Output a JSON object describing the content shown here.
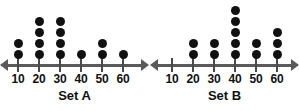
{
  "chart_data": [
    {
      "type": "bar",
      "plot_style": "dot-plot",
      "title": "Set A",
      "xlabel": "",
      "ylabel": "",
      "categories": [
        "10",
        "20",
        "30",
        "40",
        "50",
        "60"
      ],
      "values": [
        2,
        4,
        4,
        1,
        2,
        1
      ],
      "ticks": [
        10,
        20,
        30,
        40,
        50,
        60
      ],
      "axis_range": [
        10,
        60
      ],
      "axis_arrows": [
        "left",
        "right"
      ],
      "grid": false,
      "legend": "none",
      "dot_color": "#111111",
      "axis_color": "#5a5a5a"
    },
    {
      "type": "bar",
      "plot_style": "dot-plot",
      "title": "Set B",
      "xlabel": "",
      "ylabel": "",
      "categories": [
        "10",
        "20",
        "30",
        "40",
        "50",
        "60"
      ],
      "values": [
        0,
        2,
        2,
        5,
        2,
        3
      ],
      "ticks": [
        10,
        20,
        30,
        40,
        50,
        60
      ],
      "axis_range": [
        10,
        60
      ],
      "axis_arrows": [
        "left",
        "right"
      ],
      "grid": false,
      "legend": "none",
      "dot_color": "#111111",
      "axis_color": "#5a5a5a"
    }
  ],
  "plots": [
    {
      "caption": "Set A",
      "tick_labels": [
        "10",
        "20",
        "30",
        "40",
        "50",
        "60"
      ],
      "counts": [
        2,
        4,
        4,
        1,
        2,
        1
      ]
    },
    {
      "caption": "Set B",
      "tick_labels": [
        "10",
        "20",
        "30",
        "40",
        "50",
        "60"
      ],
      "counts": [
        0,
        2,
        2,
        5,
        2,
        3
      ]
    }
  ]
}
